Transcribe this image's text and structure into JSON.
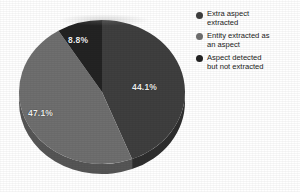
{
  "chart_data": {
    "type": "pie",
    "title": "",
    "subtitle": "",
    "xlabel": "",
    "ylabel": "",
    "three_d": true,
    "grid": false,
    "legend_position": "right",
    "start_angle_deg": 0,
    "direction": "clockwise",
    "categories": [
      "Extra aspect extracted",
      "Entity extracted as an aspect",
      "Aspect detected but not extracted"
    ],
    "values": [
      44.1,
      47.1,
      8.8
    ],
    "value_unit": "%",
    "data_labels": [
      "44.1%",
      "47.1%",
      "8.8%"
    ],
    "colors": [
      "#3f3f3f",
      "#6f6f6f",
      "#232323"
    ],
    "side_colors": [
      "#2e2e2e",
      "#565656",
      "#1a1a1a"
    ]
  },
  "slices": [
    {
      "label": "44.1%",
      "value": 44.1,
      "color": "#3f3f3f",
      "side": "#2e2e2e"
    },
    {
      "label": "47.1%",
      "value": 47.1,
      "color": "#6f6f6f",
      "side": "#565656"
    },
    {
      "label": "8.8%",
      "value": 8.8,
      "color": "#232323",
      "side": "#1a1a1a"
    }
  ],
  "legend": {
    "items": [
      {
        "marker_color": "#3f3f3f",
        "line1": "Extra aspect",
        "line2": "extracted"
      },
      {
        "marker_color": "#6f6f6f",
        "line1": "Entity extracted as",
        "line2": "an aspect"
      },
      {
        "marker_color": "#232323",
        "line1": "Aspect detected",
        "line2": "but not extracted"
      }
    ]
  },
  "colors": {
    "background": "#ffffff",
    "label_text": "#f2f2f2",
    "legend_text": "#1b1b1b"
  }
}
